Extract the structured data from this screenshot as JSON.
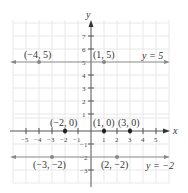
{
  "diagram": {
    "type": "coordinate-plane",
    "axes": {
      "x_label": "x",
      "y_label": "y",
      "x_range": [
        -5,
        5
      ],
      "y_range": [
        -3,
        7
      ]
    },
    "x_ticks": [
      "−5",
      "−4",
      "−3",
      "−2",
      "−1",
      "1",
      "2",
      "3",
      "4",
      "5"
    ],
    "y_ticks": [
      "7",
      "6",
      "5",
      "4",
      "3",
      "2",
      "1",
      "−1",
      "−2",
      "−3"
    ],
    "lines": [
      {
        "equation": "y = 5",
        "label": "y = 5"
      },
      {
        "equation": "y = −2",
        "label": "y = −2"
      }
    ],
    "points": [
      {
        "label": "(−4, 5)",
        "x": -4,
        "y": 5
      },
      {
        "label": "(1, 5)",
        "x": 1,
        "y": 5
      },
      {
        "label": "(−2, 0)",
        "x": -2,
        "y": 0
      },
      {
        "label": "(1, 0)",
        "x": 1,
        "y": 0
      },
      {
        "label": "(3, 0)",
        "x": 3,
        "y": 0
      },
      {
        "label": "(−3, −2)",
        "x": -3,
        "y": -2
      },
      {
        "label": "(2, −2)",
        "x": 2,
        "y": -2
      }
    ],
    "colors": {
      "grid": "#e6e6e6",
      "axis": "#555555",
      "line": "#8a8a8a",
      "point": "#333333"
    }
  }
}
